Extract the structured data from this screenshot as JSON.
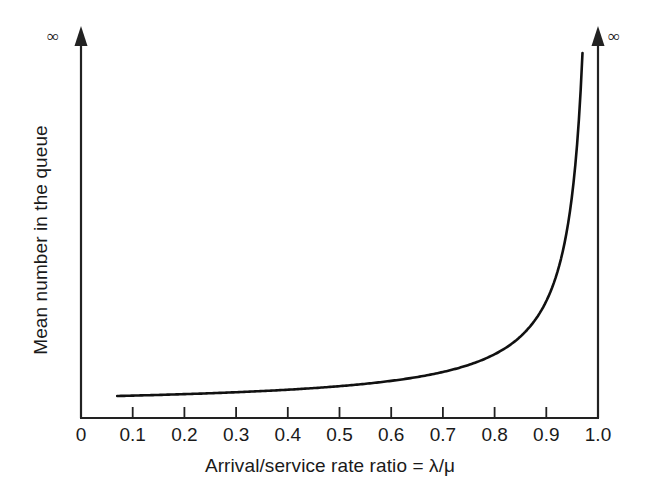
{
  "chart_data": {
    "type": "line",
    "title": "",
    "xlabel": "Arrival/service rate ratio = λ/μ",
    "ylabel": "Mean number in the queue",
    "xlim": [
      0,
      1.0
    ],
    "xticks": [
      0,
      0.1,
      0.2,
      0.3,
      0.4,
      0.5,
      0.6,
      0.7,
      0.8,
      0.9,
      1.0
    ],
    "xtick_labels": [
      "0",
      "0.1",
      "0.2",
      "0.3",
      "0.4",
      "0.5",
      "0.6",
      "0.7",
      "0.8",
      "0.9",
      "1.0"
    ],
    "yticks": [],
    "ytick_labels": [],
    "y_axis_top_symbol": "∞",
    "right_axis_top_symbol": "∞",
    "grid": false,
    "legend": null,
    "series": [
      {
        "name": "Mean queue length",
        "formula": "rho / (1 - rho)",
        "x": [
          0.07,
          0.1,
          0.15,
          0.2,
          0.25,
          0.3,
          0.35,
          0.4,
          0.45,
          0.5,
          0.55,
          0.6,
          0.65,
          0.7,
          0.75,
          0.8,
          0.84,
          0.87,
          0.9,
          0.92,
          0.94,
          0.95,
          0.96,
          0.965,
          0.97
        ],
        "y": [
          0.075,
          0.111,
          0.176,
          0.25,
          0.333,
          0.429,
          0.538,
          0.667,
          0.818,
          1.0,
          1.222,
          1.5,
          1.857,
          2.333,
          3.0,
          4.0,
          5.25,
          6.692,
          9.0,
          11.5,
          15.67,
          19.0,
          24.0,
          27.57,
          32.33
        ],
        "color": "#111111",
        "width": 2.6
      }
    ]
  },
  "annotations": {
    "infinity_top_left": "∞",
    "infinity_top_right": "∞"
  },
  "colors": {
    "background": "#ffffff",
    "axis": "#222222",
    "curve": "#111111",
    "text": "#1a1a1a"
  }
}
